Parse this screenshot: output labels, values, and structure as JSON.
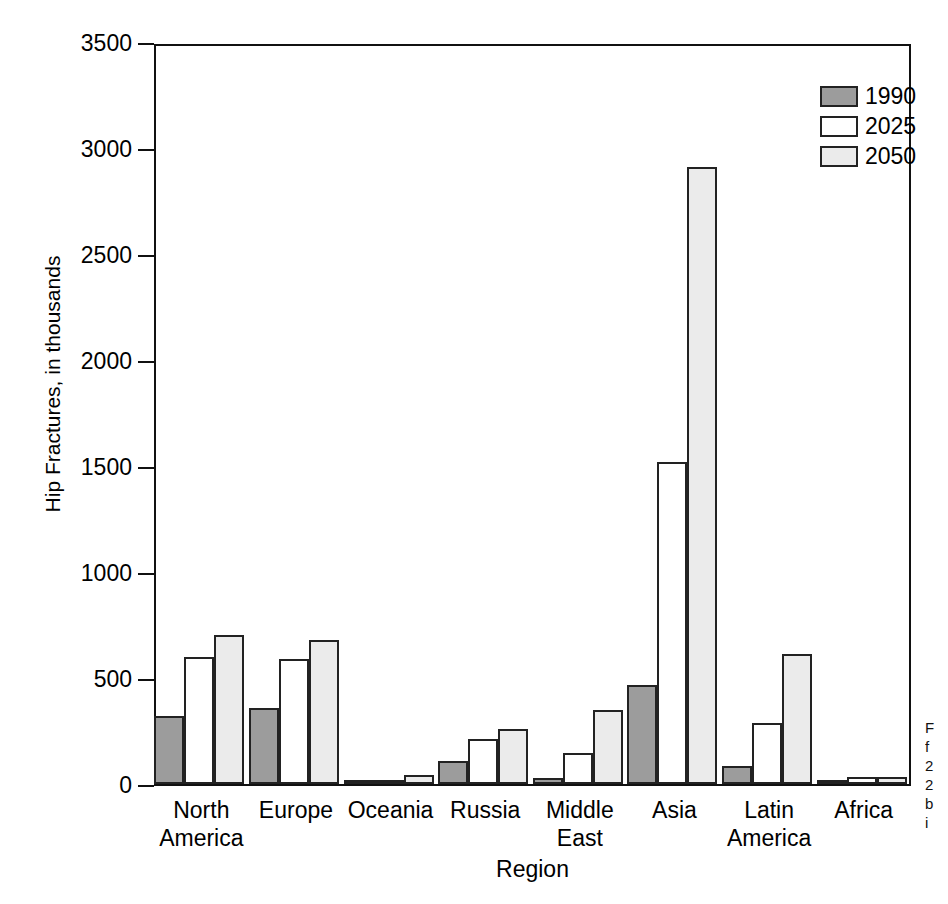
{
  "chart_data": {
    "type": "bar",
    "title": "",
    "xlabel": "Region",
    "ylabel": "Hip Fractures, in thousands",
    "ylim": [
      0,
      3500
    ],
    "ytick_labels": [
      "3500",
      "3000",
      "2500",
      "2000",
      "1500",
      "1000",
      "500",
      "0"
    ],
    "yticks": [
      3500,
      3000,
      2500,
      2000,
      1500,
      1000,
      500,
      0
    ],
    "grid": false,
    "legend_position": "top-right",
    "categories": [
      "North America",
      "Europe",
      "Oceania",
      "Russia",
      "Middle East",
      "Asia",
      "Latin America",
      "Africa"
    ],
    "category_lines": [
      [
        "North",
        "America"
      ],
      [
        "Europe",
        ""
      ],
      [
        "Oceania",
        ""
      ],
      [
        "Russia",
        ""
      ],
      [
        "Middle",
        "East"
      ],
      [
        "Asia",
        ""
      ],
      [
        "Latin",
        "America"
      ],
      [
        "Africa",
        ""
      ]
    ],
    "series": [
      {
        "name": "1990",
        "color": "#9c9c9c",
        "values": [
          320,
          360,
          5,
          110,
          30,
          465,
          85,
          8
        ]
      },
      {
        "name": "2025",
        "color": "#ffffff",
        "values": [
          600,
          590,
          20,
          210,
          145,
          1520,
          290,
          35
        ]
      },
      {
        "name": "2050",
        "color": "#ebebeb",
        "values": [
          705,
          680,
          42,
          258,
          350,
          2910,
          615,
          35
        ]
      }
    ]
  },
  "side_caption": {
    "lines": [
      "F",
      "f",
      "2",
      "2",
      "b",
      "i"
    ]
  }
}
